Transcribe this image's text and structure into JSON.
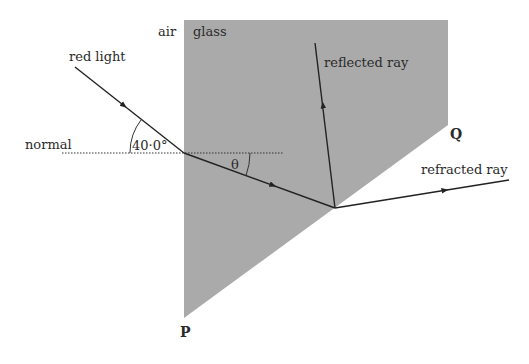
{
  "labels": {
    "air": "air",
    "glass": "glass",
    "red_light": "red light",
    "normal": "normal",
    "angle_incidence": "40·0°",
    "theta": "θ",
    "reflected_ray": "reflected ray",
    "refracted_ray": "refracted ray",
    "corner_p": "P",
    "corner_q": "Q"
  },
  "colors": {
    "glass_fill": "#aaaaaa",
    "ray": "#222222",
    "background": "#ffffff"
  },
  "geometry": {
    "glass_polygon": [
      [
        184,
        20
      ],
      [
        448,
        20
      ],
      [
        448,
        125
      ],
      [
        184,
        318
      ]
    ],
    "incident_ray": {
      "from": [
        75,
        67
      ],
      "to": [
        184,
        153
      ]
    },
    "ray_in_glass": {
      "from": [
        184,
        153
      ],
      "to": [
        335,
        208
      ]
    },
    "reflected_ray": {
      "from": [
        335,
        208
      ],
      "to": [
        315,
        43
      ]
    },
    "refracted_ray": {
      "from": [
        335,
        208
      ],
      "to": [
        509,
        180
      ]
    },
    "normal_line": {
      "from": [
        62,
        153
      ],
      "to": [
        283,
        153
      ]
    },
    "incidence_angle_deg": 40.0
  }
}
